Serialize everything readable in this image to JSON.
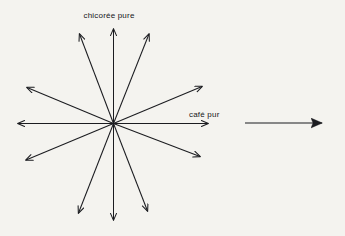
{
  "figure": {
    "title_alt": "diagramme en étoile",
    "background_color": "#f4f3ef",
    "ink_color": "#1b1c20",
    "labels": {
      "top_axis": "chicorée pure",
      "right_axis": "café pur"
    },
    "star": {
      "center": {
        "x": 113.5,
        "y": 123.5
      },
      "ray_count": 10,
      "double_arrow_count": 5,
      "rays": [
        {
          "name": "up",
          "angle_deg": 90,
          "tip": {
            "x": 113.5,
            "y": 27
          }
        },
        {
          "name": "down",
          "angle_deg": -90,
          "tip": {
            "x": 113.5,
            "y": 222
          }
        },
        {
          "name": "right",
          "angle_deg": 0,
          "tip": {
            "x": 210,
            "y": 123.5
          }
        },
        {
          "name": "left",
          "angle_deg": 180,
          "tip": {
            "x": 16,
            "y": 123.5
          }
        },
        {
          "name": "up-right-steep",
          "angle_deg": 72,
          "tip": {
            "x": 150,
            "y": 32
          }
        },
        {
          "name": "down-left-steep",
          "angle_deg": -108,
          "tip": {
            "x": 77,
            "y": 215
          }
        },
        {
          "name": "up-right-shallow",
          "angle_deg": 27,
          "tip": {
            "x": 204,
            "y": 85
          }
        },
        {
          "name": "down-left-shallow",
          "angle_deg": -153,
          "tip": {
            "x": 24,
            "y": 161
          }
        },
        {
          "name": "up-left-steep",
          "angle_deg": 117,
          "tip": {
            "x": 78,
            "y": 32
          }
        },
        {
          "name": "down-right-steep",
          "angle_deg": -63,
          "tip": {
            "x": 149,
            "y": 213
          }
        },
        {
          "name": "up-left-shallow",
          "angle_deg": 153,
          "tip": {
            "x": 25,
            "y": 86
          }
        },
        {
          "name": "down-right-shallow",
          "angle_deg": -27,
          "tip": {
            "x": 202,
            "y": 158
          }
        }
      ]
    },
    "side_arrow": {
      "name": "reference-arrow",
      "start": {
        "x": 245,
        "y": 123
      },
      "end": {
        "x": 333,
        "y": 123
      },
      "head_style": "solid-filled-triangle"
    }
  }
}
